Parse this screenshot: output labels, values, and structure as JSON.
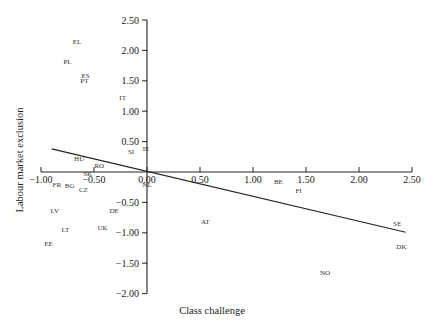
{
  "chart_data": {
    "type": "scatter",
    "title": "",
    "xlabel": "Class challenge",
    "ylabel": "Labour market exclusion",
    "xlim": [
      -1.0,
      2.5
    ],
    "ylim": [
      -2.0,
      2.5
    ],
    "x_ticks": [
      "-1.00",
      "-0.50",
      "0.00",
      "0.50",
      "1.00",
      "1.50",
      "2.00",
      "2.50"
    ],
    "y_ticks": [
      "2.50",
      "2.00",
      "1.50",
      "1.00",
      "0.50",
      "-0.50",
      "-1.00",
      "-1.50",
      "-2.00"
    ],
    "grid": false,
    "legend": null,
    "points": [
      {
        "label": "EL",
        "x": -0.66,
        "y": 2.14
      },
      {
        "label": "PL",
        "x": -0.75,
        "y": 1.81
      },
      {
        "label": "ES",
        "x": -0.58,
        "y": 1.58
      },
      {
        "label": "PT",
        "x": -0.59,
        "y": 1.5
      },
      {
        "label": "IT",
        "x": -0.23,
        "y": 1.23
      },
      {
        "label": "IE",
        "x": -0.01,
        "y": 0.39
      },
      {
        "label": "SI",
        "x": -0.15,
        "y": 0.33
      },
      {
        "label": "HU",
        "x": -0.64,
        "y": 0.23
      },
      {
        "label": "RO",
        "x": -0.45,
        "y": 0.1
      },
      {
        "label": "SK",
        "x": -0.56,
        "y": -0.02
      },
      {
        "label": "FR",
        "x": -0.85,
        "y": -0.21
      },
      {
        "label": "BG",
        "x": -0.73,
        "y": -0.23
      },
      {
        "label": "CZ",
        "x": -0.6,
        "y": -0.28
      },
      {
        "label": "NL",
        "x": 0.0,
        "y": -0.21
      },
      {
        "label": "LV",
        "x": -0.87,
        "y": -0.64
      },
      {
        "label": "DE",
        "x": -0.31,
        "y": -0.63
      },
      {
        "label": "LT",
        "x": -0.77,
        "y": -0.95
      },
      {
        "label": "UK",
        "x": -0.42,
        "y": -0.92
      },
      {
        "label": "EE",
        "x": -0.93,
        "y": -1.17
      },
      {
        "label": "AT",
        "x": 0.55,
        "y": -0.82
      },
      {
        "label": "BE",
        "x": 1.24,
        "y": -0.16
      },
      {
        "label": "FI",
        "x": 1.43,
        "y": -0.3
      },
      {
        "label": "SE",
        "x": 2.36,
        "y": -0.84
      },
      {
        "label": "DK",
        "x": 2.4,
        "y": -1.22
      },
      {
        "label": "NO",
        "x": 1.68,
        "y": -1.66
      }
    ],
    "regression_line": {
      "x1": -0.9,
      "y1": 0.38,
      "x2": 2.44,
      "y2": -0.99
    }
  }
}
